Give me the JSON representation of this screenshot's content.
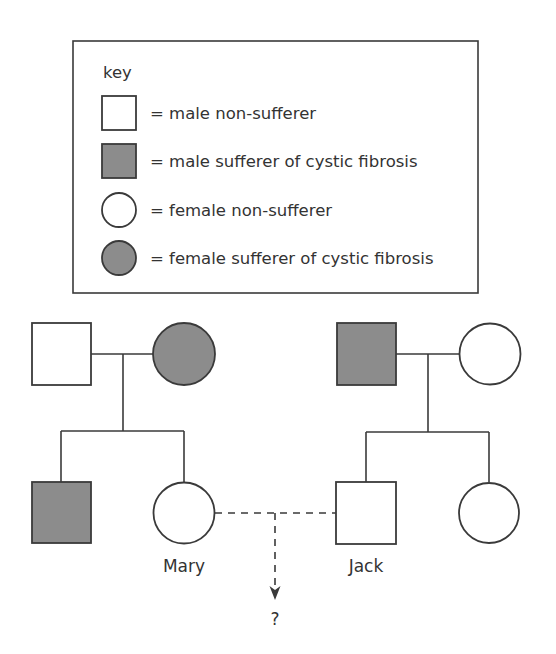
{
  "colors": {
    "line": "#3a3a3a",
    "sufferer_fill": "#8c8c8c",
    "non_sufferer_fill": "#ffffff"
  },
  "key": {
    "title": "key",
    "items": [
      {
        "symbol": "square",
        "filled": false,
        "label": "= male non-sufferer"
      },
      {
        "symbol": "square",
        "filled": true,
        "label": "= male sufferer of cystic fibrosis"
      },
      {
        "symbol": "circle",
        "filled": false,
        "label": "= female non-sufferer"
      },
      {
        "symbol": "circle",
        "filled": true,
        "label": "= female sufferer of cystic fibrosis"
      }
    ]
  },
  "pedigree": {
    "left_family": {
      "father": {
        "sex": "male",
        "affected": false
      },
      "mother": {
        "sex": "female",
        "affected": true
      },
      "children": [
        {
          "sex": "male",
          "affected": true,
          "name": ""
        },
        {
          "sex": "female",
          "affected": false,
          "name": "Mary"
        }
      ]
    },
    "right_family": {
      "father": {
        "sex": "male",
        "affected": true
      },
      "mother": {
        "sex": "female",
        "affected": false
      },
      "children": [
        {
          "sex": "male",
          "affected": false,
          "name": "Jack"
        },
        {
          "sex": "female",
          "affected": false,
          "name": ""
        }
      ]
    },
    "labels": {
      "mary": "Mary",
      "jack": "Jack",
      "offspring": "?"
    }
  }
}
